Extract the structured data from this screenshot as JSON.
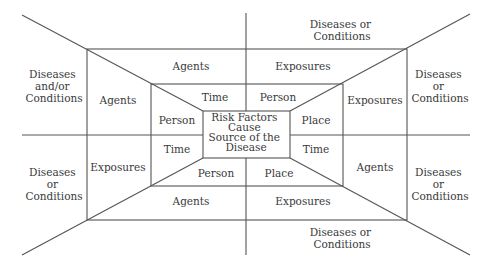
{
  "diagram": {
    "type": "nested-frame",
    "line_color": "#555555",
    "text_color": "#3a3a3a",
    "center": {
      "lines": [
        "Risk Factors",
        "Cause",
        "Source of the",
        "Disease"
      ]
    },
    "inner_ring": {
      "top_left": "Time",
      "top_right": "Person",
      "left_top": "Person",
      "left_bottom": "Time",
      "right_top": "Place",
      "right_bottom": "Time",
      "bottom_left": "Person",
      "bottom_right": "Place"
    },
    "middle_ring": {
      "top_left": "Agents",
      "top_right": "Exposures",
      "left_top": "Agents",
      "left_bottom": "Exposures",
      "right_top": "Exposures",
      "right_bottom": "Agents",
      "bottom_left": "Agents",
      "bottom_right": "Exposures"
    },
    "outer_ring": {
      "top_right": [
        "Diseases or",
        "Conditions"
      ],
      "left_top": [
        "Diseases",
        "and/or",
        "Conditions"
      ],
      "right_top": [
        "Diseases",
        "or",
        "Conditions"
      ],
      "left_bottom": [
        "Diseases",
        "or",
        "Conditions"
      ],
      "right_bottom": [
        "Diseases",
        "or",
        "Conditions"
      ],
      "bottom_right": [
        "Diseases or",
        "Conditions"
      ]
    }
  }
}
